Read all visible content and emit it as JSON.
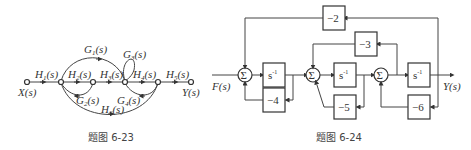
{
  "figures": [
    {
      "id": "fig-6-23",
      "caption": "题图 6-23",
      "type": "signal-flow-graph",
      "input": "X(s)",
      "output": "Y(s)",
      "branches": {
        "h1": {
          "name": "H",
          "sub": "1",
          "arg": "(s)"
        },
        "h2": {
          "name": "H",
          "sub": "2",
          "arg": "(s)"
        },
        "h3": {
          "name": "H",
          "sub": "3",
          "arg": "(s)"
        },
        "h4": {
          "name": "H",
          "sub": "4",
          "arg": "(s)"
        },
        "h5": {
          "name": "H",
          "sub": "5",
          "arg": "(s)"
        },
        "h6": {
          "name": "H",
          "sub": "6",
          "arg": "(s)"
        },
        "g1": {
          "name": "G",
          "sub": "1",
          "arg": "(s)"
        },
        "g2": {
          "name": "G",
          "sub": "2",
          "arg": "(s)"
        },
        "g3": {
          "name": "G",
          "sub": "3",
          "arg": "(s)"
        },
        "g4": {
          "name": "G",
          "sub": "4",
          "arg": "(s)"
        }
      }
    },
    {
      "id": "fig-6-24",
      "caption": "题图 6-24",
      "type": "block-diagram",
      "input": "F(s)",
      "output": "Y(s)",
      "sum_symbol": "Σ",
      "integrator": {
        "base": "s",
        "exp": "-1"
      },
      "gains": {
        "g1": "−2",
        "g2": "−3",
        "g3": "−4",
        "g4": "−5",
        "g5": "−6"
      }
    }
  ]
}
